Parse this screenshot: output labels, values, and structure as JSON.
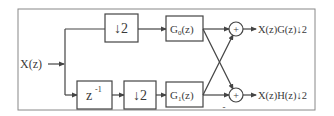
{
  "diagram": {
    "type": "block-diagram",
    "colors": {
      "stroke": "#555555",
      "text": "#3a3a3a",
      "background": "#ffffff"
    },
    "input": {
      "label": "X(z)"
    },
    "blocks": {
      "down_top": {
        "label": "↓2"
      },
      "delay": {
        "label": "z",
        "superscript": "-1"
      },
      "down_bottom": {
        "label": "↓2"
      },
      "g0": {
        "label": "G",
        "subscript": "0",
        "suffix": "(z)"
      },
      "g1": {
        "label": "G",
        "subscript": "1",
        "suffix": "(z)"
      }
    },
    "adders": {
      "top": {
        "symbol": "+"
      },
      "bottom": {
        "symbol": "+",
        "sign": "-"
      }
    },
    "outputs": {
      "top": {
        "label": "X(z)G(z)↓2"
      },
      "bottom": {
        "label": "X(z)H(z)↓2"
      }
    }
  }
}
